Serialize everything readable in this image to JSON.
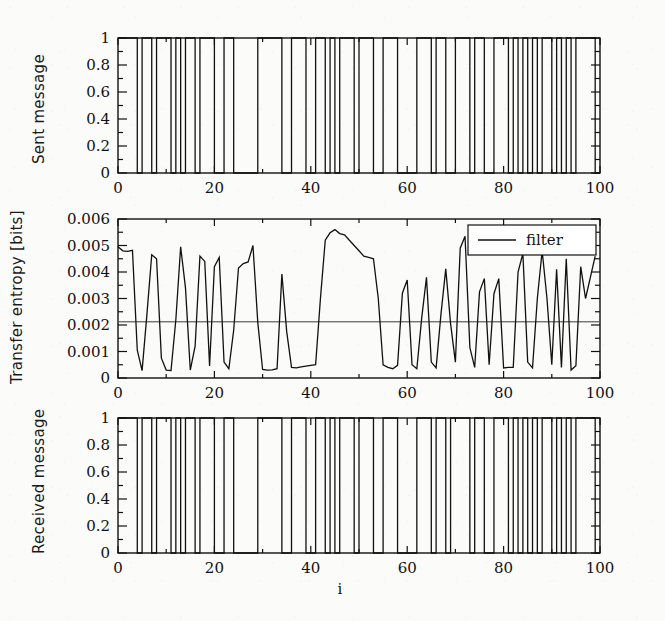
{
  "figure": {
    "background_color": "#fbfbfa",
    "line_color": "#111111",
    "xaxis_title": "i"
  },
  "panels": {
    "sent": {
      "ylabel": "Sent message",
      "ytick_labels": [
        "1",
        "0.8",
        "0.6",
        "0.4",
        "0.2",
        "0"
      ],
      "xtick_labels": [
        "0",
        "20",
        "40",
        "60",
        "80",
        "100"
      ]
    },
    "entropy": {
      "ylabel": "Transfer entropy [bits]",
      "ytick_labels": [
        "0.006",
        "0.005",
        "0.004",
        "0.003",
        "0.002",
        "0.001",
        "0"
      ],
      "xtick_labels": [
        "0",
        "20",
        "40",
        "60",
        "80",
        "100"
      ],
      "legend_label": "filter"
    },
    "received": {
      "ylabel": "Received message",
      "ytick_labels": [
        "1",
        "0.8",
        "0.6",
        "0.4",
        "0.2",
        "0"
      ],
      "xtick_labels": [
        "0",
        "20",
        "40",
        "60",
        "80",
        "100"
      ]
    }
  },
  "chart_data": [
    {
      "type": "line",
      "title": "Sent message",
      "xlabel": "i",
      "ylabel": "Sent message",
      "xlim": [
        0,
        100
      ],
      "ylim": [
        0,
        1
      ],
      "xticks": [
        0,
        20,
        40,
        60,
        80,
        100
      ],
      "yticks": [
        0,
        0.2,
        0.4,
        0.6,
        0.8,
        1
      ],
      "ytick_labels": [
        "0",
        "0.2",
        "0.4",
        "0.6",
        "0.8",
        "1"
      ],
      "grid": false,
      "legend": null,
      "step_style": "post",
      "x": [
        0,
        1,
        2,
        3,
        4,
        5,
        6,
        7,
        8,
        9,
        10,
        11,
        12,
        13,
        14,
        15,
        16,
        17,
        18,
        19,
        20,
        21,
        22,
        23,
        24,
        25,
        26,
        27,
        28,
        29,
        30,
        31,
        32,
        33,
        34,
        35,
        36,
        37,
        38,
        39,
        40,
        41,
        42,
        43,
        44,
        45,
        46,
        47,
        48,
        49,
        50,
        51,
        52,
        53,
        54,
        55,
        56,
        57,
        58,
        59,
        60,
        61,
        62,
        63,
        64,
        65,
        66,
        67,
        68,
        69,
        70,
        71,
        72,
        73,
        74,
        75,
        76,
        77,
        78,
        79,
        80,
        81,
        82,
        83,
        84,
        85,
        86,
        87,
        88,
        89,
        90,
        91,
        92,
        93,
        94,
        95,
        96,
        97,
        98,
        99
      ],
      "values": [
        1,
        1,
        1,
        1,
        0,
        1,
        1,
        0,
        1,
        1,
        1,
        0,
        1,
        0,
        1,
        1,
        0,
        1,
        1,
        1,
        0,
        0,
        1,
        1,
        0,
        0,
        0,
        0,
        0,
        1,
        1,
        1,
        1,
        1,
        0,
        0,
        1,
        1,
        1,
        0,
        0,
        1,
        1,
        0,
        1,
        0,
        1,
        1,
        1,
        0,
        1,
        1,
        1,
        0,
        0,
        1,
        1,
        1,
        0,
        0,
        0,
        0,
        1,
        1,
        1,
        0,
        1,
        1,
        0,
        0,
        1,
        1,
        1,
        0,
        1,
        1,
        0,
        0,
        1,
        1,
        1,
        0,
        1,
        0,
        1,
        0,
        1,
        0,
        1,
        1,
        0,
        1,
        0,
        1,
        0,
        1,
        1,
        1,
        1,
        0
      ]
    },
    {
      "type": "line",
      "title": "Transfer entropy",
      "xlabel": "i",
      "ylabel": "Transfer entropy [bits]",
      "xlim": [
        0,
        100
      ],
      "ylim": [
        0,
        0.006
      ],
      "xticks": [
        0,
        20,
        40,
        60,
        80,
        100
      ],
      "yticks": [
        0,
        0.001,
        0.002,
        0.003,
        0.004,
        0.005,
        0.006
      ],
      "ytick_labels": [
        "0",
        "0.001",
        "0.002",
        "0.003",
        "0.004",
        "0.005",
        "0.006"
      ],
      "grid": false,
      "legend": {
        "entries": [
          "filter"
        ],
        "position": "upper right"
      },
      "annotations": [
        {
          "type": "hline",
          "label": "filter",
          "y": 0.00212
        }
      ],
      "x": [
        0,
        1,
        2,
        3,
        4,
        5,
        6,
        7,
        8,
        9,
        10,
        11,
        12,
        13,
        14,
        15,
        16,
        17,
        18,
        19,
        20,
        21,
        22,
        23,
        24,
        25,
        26,
        27,
        28,
        29,
        30,
        31,
        32,
        33,
        34,
        35,
        36,
        37,
        38,
        39,
        40,
        41,
        42,
        43,
        44,
        45,
        46,
        47,
        48,
        49,
        50,
        51,
        52,
        53,
        54,
        55,
        56,
        57,
        58,
        59,
        60,
        61,
        62,
        63,
        64,
        65,
        66,
        67,
        68,
        69,
        70,
        71,
        72,
        73,
        74,
        75,
        76,
        77,
        78,
        79,
        80,
        81,
        82,
        83,
        84,
        85,
        86,
        87,
        88,
        89,
        90,
        91,
        92,
        93,
        94,
        95,
        96,
        97,
        98,
        99
      ],
      "values": [
        0.00495,
        0.0048,
        0.00478,
        0.00482,
        0.00105,
        0.00028,
        0.0024,
        0.00465,
        0.0045,
        0.00075,
        0.0003,
        0.00028,
        0.0022,
        0.00495,
        0.0034,
        0.0003,
        0.0012,
        0.0046,
        0.0044,
        0.00045,
        0.0042,
        0.00455,
        0.0006,
        0.00035,
        0.0018,
        0.00415,
        0.00432,
        0.00438,
        0.005,
        0.0021,
        0.00032,
        0.0003,
        0.00031,
        0.00035,
        0.00392,
        0.00175,
        0.0004,
        0.00038,
        0.00042,
        0.00045,
        0.00048,
        0.0005,
        0.003,
        0.0052,
        0.00548,
        0.0056,
        0.00545,
        0.0054,
        0.0052,
        0.005,
        0.0048,
        0.0046,
        0.00455,
        0.0045,
        0.003,
        0.0005,
        0.0004,
        0.00035,
        0.00048,
        0.0032,
        0.0037,
        0.0005,
        0.00035,
        0.00225,
        0.0038,
        0.0006,
        0.00038,
        0.0024,
        0.00412,
        0.00205,
        0.0006,
        0.0049,
        0.00535,
        0.00115,
        0.0004,
        0.00325,
        0.00375,
        0.0005,
        0.00318,
        0.00375,
        0.00038,
        0.0004,
        0.0004,
        0.004,
        0.0047,
        0.0006,
        0.00038,
        0.003,
        0.0048,
        0.003,
        0.0005,
        0.0041,
        0.0004,
        0.0045,
        0.0003,
        0.00046,
        0.0042,
        0.003,
        0.0038,
        0.0046,
        0.00205,
        0.0027
      ]
    },
    {
      "type": "line",
      "title": "Received message",
      "xlabel": "i",
      "ylabel": "Received message",
      "xlim": [
        0,
        100
      ],
      "ylim": [
        0,
        1
      ],
      "xticks": [
        0,
        20,
        40,
        60,
        80,
        100
      ],
      "yticks": [
        0,
        0.2,
        0.4,
        0.6,
        0.8,
        1
      ],
      "ytick_labels": [
        "0",
        "0.2",
        "0.4",
        "0.6",
        "0.8",
        "1"
      ],
      "grid": false,
      "legend": null,
      "step_style": "post",
      "x": [
        0,
        1,
        2,
        3,
        4,
        5,
        6,
        7,
        8,
        9,
        10,
        11,
        12,
        13,
        14,
        15,
        16,
        17,
        18,
        19,
        20,
        21,
        22,
        23,
        24,
        25,
        26,
        27,
        28,
        29,
        30,
        31,
        32,
        33,
        34,
        35,
        36,
        37,
        38,
        39,
        40,
        41,
        42,
        43,
        44,
        45,
        46,
        47,
        48,
        49,
        50,
        51,
        52,
        53,
        54,
        55,
        56,
        57,
        58,
        59,
        60,
        61,
        62,
        63,
        64,
        65,
        66,
        67,
        68,
        69,
        70,
        71,
        72,
        73,
        74,
        75,
        76,
        77,
        78,
        79,
        80,
        81,
        82,
        83,
        84,
        85,
        86,
        87,
        88,
        89,
        90,
        91,
        92,
        93,
        94,
        95,
        96,
        97,
        98,
        99
      ],
      "values": [
        1,
        1,
        1,
        1,
        0,
        1,
        1,
        0,
        1,
        1,
        1,
        0,
        1,
        0,
        1,
        1,
        0,
        1,
        1,
        1,
        0,
        0,
        1,
        1,
        0,
        0,
        0,
        0,
        0,
        1,
        1,
        1,
        1,
        1,
        0,
        0,
        1,
        1,
        1,
        0,
        0,
        1,
        1,
        0,
        1,
        0,
        1,
        1,
        1,
        0,
        1,
        1,
        1,
        0,
        0,
        1,
        1,
        1,
        0,
        0,
        0,
        0,
        1,
        1,
        1,
        0,
        1,
        1,
        0,
        1,
        1,
        1,
        1,
        0,
        1,
        1,
        0,
        0,
        1,
        1,
        1,
        0,
        1,
        0,
        1,
        0,
        1,
        0,
        1,
        1,
        0,
        1,
        0,
        1,
        0,
        1,
        1,
        1,
        1,
        0
      ]
    }
  ]
}
